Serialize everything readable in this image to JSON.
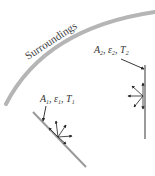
{
  "diagram": {
    "surroundings_label": "Surroundings",
    "surface2": {
      "A": "A",
      "A_sub": "2",
      "eps": "ε",
      "eps_sub": "2",
      "T": "T",
      "T_sub": "2"
    },
    "surface1": {
      "A": "A",
      "A_sub": "1",
      "eps": "ε",
      "eps_sub": "1",
      "T": "T",
      "T_sub": "1"
    },
    "colors": {
      "surroundings": "#b5b5b5",
      "surface": "#9a9a9a",
      "arrows": "#222222",
      "text": "#333333"
    }
  }
}
